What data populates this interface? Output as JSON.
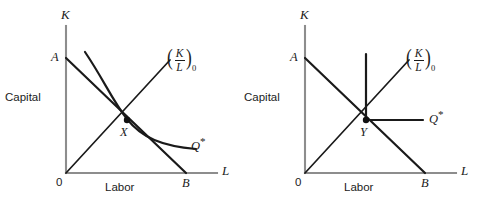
{
  "figure": {
    "panels": [
      {
        "id": "left",
        "axes": {
          "y_axis_symbol": "K",
          "x_axis_symbol": "L",
          "y_axis_name": "Capital",
          "x_axis_name": "Labor",
          "origin_label": "0"
        },
        "labels": {
          "isocost_intercept_k": "A",
          "isocost_intercept_l": "B",
          "optimum_point": "X",
          "isoquant": "Q*",
          "ray": {
            "numerator": "K",
            "denominator": "L",
            "subscript": "0"
          }
        },
        "geometry": {
          "origin": [
            66,
            173
          ],
          "y_axis_top": [
            66,
            26
          ],
          "x_axis_right": [
            217,
            173
          ],
          "isocost": {
            "from": [
              66,
              58
            ],
            "to": [
              186,
              173
            ]
          },
          "ray": {
            "from": [
              66,
              173
            ],
            "to": [
              170,
              60
            ]
          },
          "isoquant_path": "M 85,52 C 104,80 112,100 127,119 C 142,138 162,146 196,149",
          "optimum_dot": [
            127,
            120
          ]
        }
      },
      {
        "id": "right",
        "axes": {
          "y_axis_symbol": "K",
          "x_axis_symbol": "L",
          "y_axis_name": "Capital",
          "x_axis_name": "Labor",
          "origin_label": "0"
        },
        "labels": {
          "isocost_intercept_k": "A",
          "isocost_intercept_l": "B",
          "optimum_point": "Y",
          "isoquant": "Q*",
          "ray": {
            "numerator": "K",
            "denominator": "L",
            "subscript": "0"
          }
        },
        "geometry": {
          "origin": [
            66,
            173
          ],
          "y_axis_top": [
            66,
            26
          ],
          "x_axis_right": [
            217,
            173
          ],
          "isocost": {
            "from": [
              66,
              58
            ],
            "to": [
              186,
              173
            ]
          },
          "ray": {
            "from": [
              66,
              173
            ],
            "to": [
              170,
              60
            ]
          },
          "isoquant_vertical": {
            "from": [
              127,
              120
            ],
            "to": [
              127,
              54
            ]
          },
          "isoquant_horizontal": {
            "from": [
              127,
              120
            ],
            "to": [
              184,
              120
            ]
          },
          "optimum_dot": [
            127,
            120
          ]
        }
      }
    ]
  },
  "colors": {
    "axis": "#8d8d8d",
    "data_line": "#1a1a1a",
    "text": "#1b1b1b",
    "background": "#ffffff"
  }
}
